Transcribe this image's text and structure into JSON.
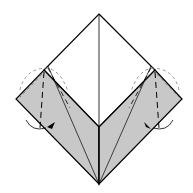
{
  "diagram": {
    "type": "origami-fold-step",
    "colors": {
      "paper_white": "#ffffff",
      "paper_colored": "#c8c8c8",
      "line": "#000000",
      "dashed": "#555555"
    },
    "elements": [
      {
        "name": "top-diamond",
        "description": "white upper square face with vertical center crease"
      },
      {
        "name": "left-flap",
        "description": "gray flap with valley-fold lines and rotation arrow"
      },
      {
        "name": "right-flap",
        "description": "gray flap with valley-fold lines and rotation arrow"
      }
    ]
  }
}
